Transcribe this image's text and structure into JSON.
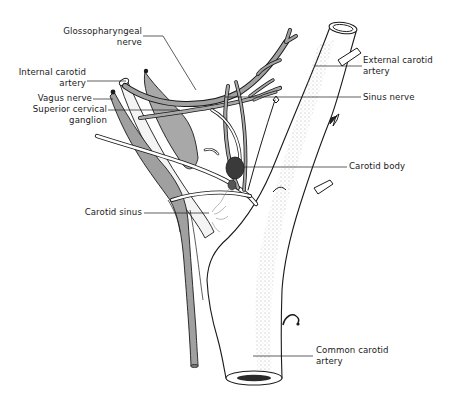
{
  "diagram": {
    "colors": {
      "outline": "#1a1a1a",
      "nerve_gray": "#9a9a9a",
      "ganglion_gray": "#a8a8a8",
      "stipple": "#b5b5b5",
      "carotid_body": "#3a3a3a",
      "background": "#ffffff"
    },
    "labels": {
      "glossopharyngeal": {
        "line1": "Glossopharyngeal",
        "line2": "nerve"
      },
      "internal_carotid": {
        "line1": "Internal carotid",
        "line2": "artery"
      },
      "vagus": {
        "line1": "Vagus nerve"
      },
      "superior_cervical": {
        "line1": "Superior cervical",
        "line2": "ganglion"
      },
      "external_carotid": {
        "line1": "External carotid",
        "line2": "artery"
      },
      "sinus_nerve": {
        "line1": "Sinus nerve"
      },
      "carotid_body": {
        "line1": "Carotid body"
      },
      "carotid_sinus": {
        "line1": "Carotid sinus"
      },
      "common_carotid": {
        "line1": "Common carotid",
        "line2": "artery"
      }
    }
  }
}
